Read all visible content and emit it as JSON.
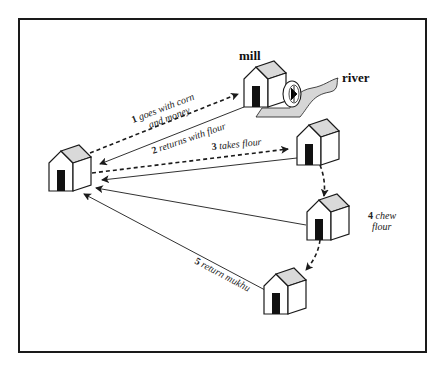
{
  "diagram": {
    "labels": {
      "mill": "mill",
      "river": "river"
    },
    "steps": [
      {
        "num": "1",
        "text_line1": "goes with corn",
        "text_line2": "and money",
        "style": "dashed",
        "from": "home",
        "to": "mill"
      },
      {
        "num": "2",
        "text": "returns with flour",
        "style": "solid",
        "from": "mill",
        "to": "home"
      },
      {
        "num": "3",
        "text": "takes flour",
        "style": "dashed",
        "from": "home",
        "to": "neighbor-1"
      },
      {
        "num": "4",
        "text_line1": "chew",
        "text_line2": "flour",
        "style": "dashed",
        "from": "neighbor-1",
        "to": "neighbor-3"
      },
      {
        "num": "5",
        "text": "return mukhu",
        "style": "solid",
        "from": "neighbors",
        "to": "home"
      }
    ],
    "nodes": [
      "home",
      "mill",
      "neighbor-1",
      "neighbor-2",
      "neighbor-3"
    ],
    "colors": {
      "line": "#1a1a1a",
      "roof": "#d9d9d9",
      "door": "#111111",
      "river": "#d6d6d6"
    }
  }
}
